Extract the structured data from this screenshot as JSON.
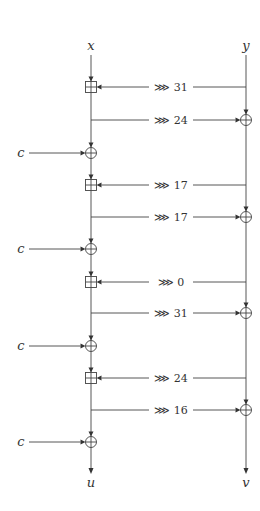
{
  "diagram": {
    "type": "ARX quarter-round structure",
    "inputs": {
      "left": "x",
      "right": "y"
    },
    "outputs": {
      "left": "u",
      "right": "v"
    },
    "constant_label": "c",
    "rotate_symbol": "⋙",
    "colors": {
      "line": "#444444",
      "text": "#333333",
      "background": "#ffffff"
    },
    "steps": [
      {
        "kind": "add",
        "from": "y",
        "to": "x",
        "op": "modular-add",
        "label": "⋙ 31",
        "rotation": 31,
        "y": 87
      },
      {
        "kind": "xor",
        "from": "x",
        "to": "y",
        "op": "xor",
        "label": "⋙ 24",
        "rotation": 24,
        "y": 120
      },
      {
        "kind": "constant",
        "to": "x",
        "op": "xor",
        "label": "c",
        "y": 153
      },
      {
        "kind": "add",
        "from": "y",
        "to": "x",
        "op": "modular-add",
        "label": "⋙ 17",
        "rotation": 17,
        "y": 185
      },
      {
        "kind": "xor",
        "from": "x",
        "to": "y",
        "op": "xor",
        "label": "⋙ 17",
        "rotation": 17,
        "y": 217
      },
      {
        "kind": "constant",
        "to": "x",
        "op": "xor",
        "label": "c",
        "y": 249
      },
      {
        "kind": "add",
        "from": "y",
        "to": "x",
        "op": "modular-add",
        "label": "⋙ 0",
        "rotation": 0,
        "y": 282
      },
      {
        "kind": "xor",
        "from": "x",
        "to": "y",
        "op": "xor",
        "label": "⋙ 31",
        "rotation": 31,
        "y": 313
      },
      {
        "kind": "constant",
        "to": "x",
        "op": "xor",
        "label": "c",
        "y": 346
      },
      {
        "kind": "add",
        "from": "y",
        "to": "x",
        "op": "modular-add",
        "label": "⋙ 24",
        "rotation": 24,
        "y": 378
      },
      {
        "kind": "xor",
        "from": "x",
        "to": "y",
        "op": "xor",
        "label": "⋙ 16",
        "rotation": 16,
        "y": 410
      },
      {
        "kind": "constant",
        "to": "x",
        "op": "xor",
        "label": "c",
        "y": 442
      }
    ]
  }
}
